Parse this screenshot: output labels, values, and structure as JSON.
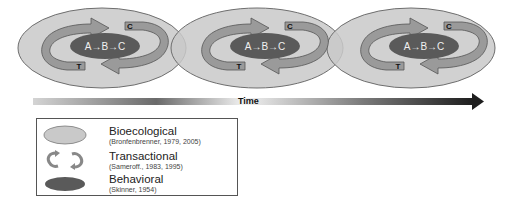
{
  "diagram": {
    "stages": [
      {
        "behavior_label": "A→B→C",
        "top_tag": "C",
        "bottom_tag": "T"
      },
      {
        "behavior_label": "A→B→C",
        "top_tag": "C",
        "bottom_tag": "T"
      },
      {
        "behavior_label": "A→B→C",
        "top_tag": "C",
        "bottom_tag": "T"
      }
    ],
    "time_axis": {
      "label": "Time",
      "direction": "right"
    }
  },
  "legend": {
    "items": [
      {
        "icon": "light-gray-ellipse-icon",
        "title": "Bioecological",
        "citation": "(Bronfenbrenner, 1979, 2005)"
      },
      {
        "icon": "circular-arrows-icon",
        "title": "Transactional",
        "citation": "(Sameroff., 1983, 1995)"
      },
      {
        "icon": "dark-gray-ellipse-icon",
        "title": "Behavioral",
        "citation": "(Skinner, 1954)"
      }
    ]
  },
  "colors": {
    "bioecological_fill": "#c9c9c9",
    "behavioral_fill": "#5a5a5a",
    "transactional_fill": "#9a9a9a",
    "outline": "#6e6e6e"
  }
}
